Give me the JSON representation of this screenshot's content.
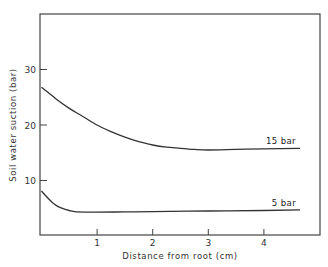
{
  "chart_data": {
    "type": "line",
    "title": "",
    "xlabel": "Distance  from  root   (cm)",
    "ylabel": "Soil  water  suction   (bar)",
    "xlim": [
      0,
      4.9
    ],
    "ylim": [
      0,
      39
    ],
    "x_ticks": [
      1,
      2,
      3,
      4
    ],
    "x_tick_labels": [
      "1",
      "2",
      "3",
      "4"
    ],
    "y_ticks": [
      10,
      20,
      30
    ],
    "y_tick_labels": [
      "10",
      "20",
      "30"
    ],
    "grid": false,
    "legend": "inline labels at right end of curves",
    "series": [
      {
        "name": "15 bar",
        "label": "15   bar",
        "x": [
          0,
          0.25,
          0.5,
          0.75,
          1.0,
          1.25,
          1.5,
          1.75,
          2.0,
          2.25,
          2.5,
          2.75,
          3.0,
          3.5,
          4.0,
          4.65
        ],
        "y": [
          26.8,
          24.8,
          23.0,
          21.5,
          20.0,
          18.8,
          17.8,
          17.0,
          16.4,
          16.0,
          15.8,
          15.6,
          15.5,
          15.6,
          15.7,
          15.8
        ]
      },
      {
        "name": "5 bar",
        "label": "5   bar",
        "x": [
          0,
          0.1,
          0.2,
          0.3,
          0.4,
          0.5,
          0.6,
          0.8,
          1.0,
          1.5,
          2.0,
          3.0,
          4.0,
          4.65
        ],
        "y": [
          8.1,
          7.0,
          6.0,
          5.3,
          4.9,
          4.6,
          4.4,
          4.3,
          4.3,
          4.35,
          4.4,
          4.5,
          4.6,
          4.7
        ]
      }
    ]
  }
}
